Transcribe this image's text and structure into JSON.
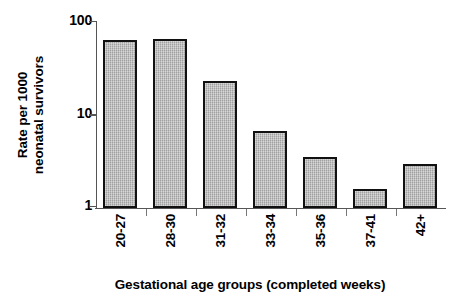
{
  "chart_data": {
    "type": "bar",
    "title": "",
    "xlabel": "Gestational age groups (completed weeks)",
    "ylabel": "Rate per 1000 neonatal survivors",
    "ylabel_lines": [
      "Rate per 1000",
      "neonatal survivors"
    ],
    "yscale": "log",
    "ylim": [
      1,
      100
    ],
    "ytick_labels": [
      "100",
      "10",
      "1"
    ],
    "ytick_values": [
      100,
      10,
      1
    ],
    "grid": false,
    "legend": "none",
    "categories": [
      "20-27",
      "28-30",
      "31-32",
      "33-34",
      "35-36",
      "37-41",
      "42+"
    ],
    "values": [
      62,
      64,
      23,
      6.6,
      3.5,
      1.6,
      2.9
    ],
    "bar_fill_color": "#b4b4b4",
    "bar_edge_color": "#111111",
    "axis_color": "#555555",
    "background_color": "#ffffff"
  }
}
